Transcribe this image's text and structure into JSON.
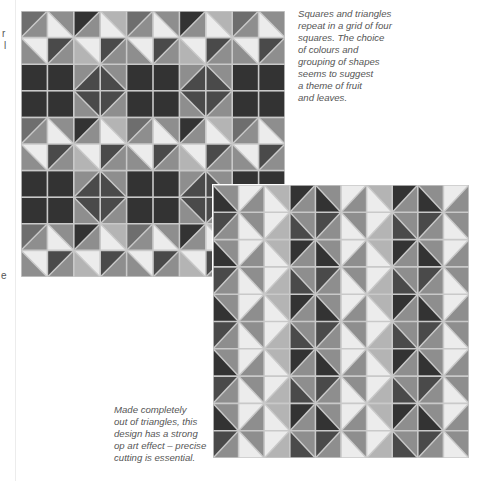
{
  "page": {
    "left_margin_fragments": [
      {
        "text": "r",
        "x": 2,
        "y": 35
      },
      {
        "text": "l",
        "x": 4,
        "y": 47
      },
      {
        "text": "e",
        "x": 1,
        "y": 276
      }
    ]
  },
  "colors": {
    "grout": "#c9c9c9",
    "white": "#ececec",
    "light": "#b4b4b4",
    "mid": "#8e8e8e",
    "midDark": "#6e6e6e",
    "dark": "#4a4a4a",
    "darkest": "#333333",
    "caption_text": "#555555"
  },
  "mosaic1": {
    "description": "Squares and triangles in a grid of four squares",
    "cols": 10,
    "rows": 10,
    "tile_pattern_period": [
      4,
      4
    ],
    "pattern": [
      [
        [
          "/",
          "midDark",
          "mid"
        ],
        [
          "\\",
          "mid",
          "white"
        ],
        [
          "/",
          "darkest",
          "mid"
        ],
        [
          "\\",
          "light",
          "white"
        ]
      ],
      [
        [
          "\\",
          "white",
          "mid"
        ],
        [
          "/",
          "dark",
          "mid"
        ],
        [
          "\\",
          "white",
          "light"
        ],
        [
          "/",
          "dark",
          "mid"
        ]
      ],
      [
        [
          "S",
          "darkest"
        ],
        [
          "S",
          "darkest"
        ],
        [
          "/",
          "mid",
          "dark"
        ],
        [
          "\\",
          "mid",
          "dark"
        ]
      ],
      [
        [
          "S",
          "darkest"
        ],
        [
          "S",
          "darkest"
        ],
        [
          "\\",
          "dark",
          "mid"
        ],
        [
          "/",
          "dark",
          "mid"
        ]
      ]
    ]
  },
  "mosaic2": {
    "description": "Made completely out of triangles, op art effect",
    "cols": 10,
    "rows": 10,
    "tile_pattern_period": [
      4,
      2
    ],
    "pattern": [
      [
        [
          "\\",
          "mid",
          "darkest"
        ],
        [
          "/",
          "white",
          "mid"
        ],
        [
          "\\",
          "light",
          "white"
        ],
        [
          "/",
          "darkest",
          "mid"
        ]
      ],
      [
        [
          "/",
          "dark",
          "mid"
        ],
        [
          "\\",
          "mid",
          "white"
        ],
        [
          "/",
          "white",
          "light"
        ],
        [
          "\\",
          "mid",
          "dark"
        ]
      ]
    ]
  },
  "captions": {
    "top_right": "Squares and triangles\nrepeat in a grid of four\nsquares. The choice\nof colours and\ngrouping of shapes\nseems to suggest\na theme of fruit\nand leaves.",
    "bottom_left": "Made completely\nout of triangles, this\ndesign has a strong\nop art effect – precise\ncutting is essential."
  }
}
